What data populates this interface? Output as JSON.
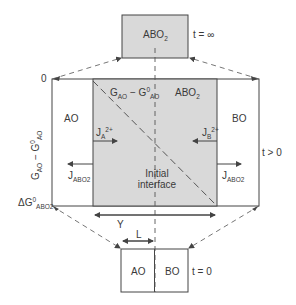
{
  "diagram": {
    "type": "interdiffusion-reaction-layer-schematic",
    "colors": {
      "product_fill": "#d9d9d9",
      "line": "#444444",
      "background": "#ffffff"
    },
    "top_box": {
      "phase": "ABO",
      "phase_sub": "2",
      "time_label": "t = ∞"
    },
    "middle": {
      "left_phase": "AO",
      "right_phase": "BO",
      "product_phase": "ABO",
      "product_phase_sub": "2",
      "time_label": "t > 0",
      "gradient_label": {
        "G": "G",
        "G_sub": "AO",
        "minus": " − ",
        "G0": "G",
        "G0_sup": "0",
        "G0_sub": "AO"
      },
      "flux_A": {
        "J": "J",
        "sub": "A",
        "sup": "2+"
      },
      "flux_B": {
        "J": "J",
        "sub": "B",
        "sup": "2+"
      },
      "flux_left": {
        "J": "J",
        "sub": "ABO",
        "sub2": "2"
      },
      "flux_right": {
        "J": "J",
        "sub": "ABO",
        "sub2": "2"
      },
      "interface_label_line1": "Initial",
      "interface_label_line2": "interface",
      "y_axis": {
        "top_tick": "0",
        "bottom_tick": {
          "D": "ΔG",
          "sup": "0",
          "sub": "ABO",
          "sub2": "2"
        },
        "label": {
          "G": "G",
          "G_sub": "AO",
          "minus": " − ",
          "G0": "G",
          "G0_sup": "0",
          "G0_sub": "AO"
        }
      },
      "dimension_Y": "Y",
      "dimension_L": "L"
    },
    "bottom_box": {
      "left_phase": "AO",
      "right_phase": "BO",
      "time_label": "t = 0"
    }
  }
}
